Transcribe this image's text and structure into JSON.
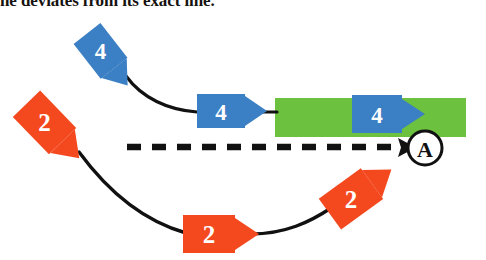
{
  "caption": {
    "text": "ne deviates from its exact line."
  },
  "colors": {
    "blue": "#3b7fc4",
    "orange": "#f4491f",
    "green": "#6cc13e",
    "line": "#111111",
    "label_text": "#ffffff",
    "background": "#ffffff"
  },
  "diagram": {
    "region": {
      "name": "green-region",
      "x": 275,
      "y": 98,
      "width": 191,
      "height": 39,
      "color": "#6cc13e"
    },
    "dashed_line": {
      "name": "dashed-reference-line",
      "x1": 127,
      "y1": 147,
      "x2": 408,
      "y2": 147,
      "color": "#111111",
      "dash": "14 11",
      "width": 6
    },
    "target_node": {
      "label": "A",
      "cx": 425,
      "cy": 148,
      "r": 17
    },
    "flows": [
      {
        "name": "blue-flow",
        "value": "4",
        "color": "#3b7fc4",
        "arrows": [
          {
            "name": "blue-arrow-1",
            "cx": 103,
            "cy": 54,
            "rotation": 52
          },
          {
            "name": "blue-arrow-2",
            "cx": 226,
            "cy": 111,
            "rotation": 0
          },
          {
            "name": "blue-arrow-3",
            "cx": 383,
            "cy": 114,
            "rotation": 0
          }
        ]
      },
      {
        "name": "orange-flow",
        "value": "2",
        "color": "#f4491f",
        "arrows": [
          {
            "name": "orange-arrow-1",
            "cx": 48,
            "cy": 126,
            "rotation": 46
          },
          {
            "name": "orange-arrow-2",
            "cx": 214,
            "cy": 234,
            "rotation": 0
          },
          {
            "name": "orange-arrow-3",
            "cx": 355,
            "cy": 196,
            "rotation": -36
          }
        ]
      }
    ]
  }
}
